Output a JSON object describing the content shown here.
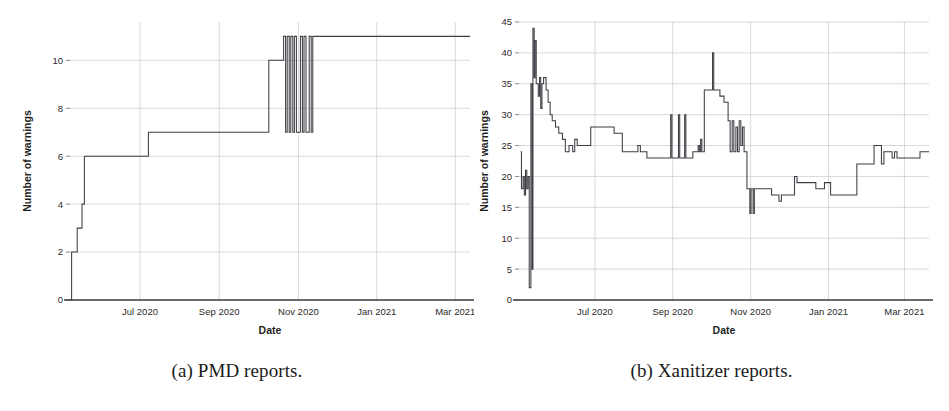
{
  "figure": {
    "subfigures": [
      {
        "key": "pmd",
        "caption": "(a) PMD reports.",
        "caption_label": "(a)",
        "caption_text": "PMD reports."
      },
      {
        "key": "xanitizer",
        "caption": "(b) Xanitizer reports.",
        "caption_label": "(b)",
        "caption_text": "Xanitizer reports."
      }
    ]
  },
  "chart_data": [
    {
      "id": "pmd",
      "type": "line",
      "title": "",
      "subtitle": "",
      "xlabel": "Date",
      "ylabel": "Number of warnings",
      "legend": [],
      "legend_position": "none",
      "grid": true,
      "grid_axes": "both",
      "step_style": "post",
      "xtick_labels": [
        "Jul 2020",
        "Sep 2020",
        "Nov 2020",
        "Jan 2021",
        "Mar 2021"
      ],
      "xtick_positions": [
        0.175,
        0.373,
        0.571,
        0.767,
        0.963
      ],
      "ytick_labels": [
        "0",
        "2",
        "4",
        "6",
        "8",
        "10"
      ],
      "ytick_values": [
        0,
        2,
        4,
        6,
        8,
        10
      ],
      "ylim": [
        0,
        11.6
      ],
      "xlim": [
        0,
        1
      ],
      "series": [
        {
          "name": "PMD warnings",
          "color": "#3d3d44",
          "points": [
            [
              0.0,
              0
            ],
            [
              0.004,
              0
            ],
            [
              0.004,
              2
            ],
            [
              0.018,
              2
            ],
            [
              0.018,
              3
            ],
            [
              0.03,
              3
            ],
            [
              0.03,
              4
            ],
            [
              0.036,
              4
            ],
            [
              0.036,
              6
            ],
            [
              0.196,
              6
            ],
            [
              0.196,
              7
            ],
            [
              0.497,
              7
            ],
            [
              0.497,
              10
            ],
            [
              0.534,
              10
            ],
            [
              0.534,
              11
            ],
            [
              0.539,
              11
            ],
            [
              0.539,
              7
            ],
            [
              0.543,
              7
            ],
            [
              0.543,
              11
            ],
            [
              0.548,
              11
            ],
            [
              0.548,
              7
            ],
            [
              0.552,
              7
            ],
            [
              0.552,
              11
            ],
            [
              0.557,
              11
            ],
            [
              0.557,
              7
            ],
            [
              0.561,
              7
            ],
            [
              0.561,
              11
            ],
            [
              0.566,
              11
            ],
            [
              0.566,
              7
            ],
            [
              0.576,
              7
            ],
            [
              0.576,
              11
            ],
            [
              0.581,
              11
            ],
            [
              0.581,
              7
            ],
            [
              0.585,
              7
            ],
            [
              0.585,
              11
            ],
            [
              0.59,
              11
            ],
            [
              0.59,
              7
            ],
            [
              0.598,
              7
            ],
            [
              0.598,
              11
            ],
            [
              0.603,
              11
            ],
            [
              0.603,
              7
            ],
            [
              0.607,
              7
            ],
            [
              0.607,
              11
            ],
            [
              1.0,
              11
            ]
          ]
        }
      ]
    },
    {
      "id": "xanitizer",
      "type": "line",
      "title": "",
      "subtitle": "",
      "xlabel": "Date",
      "ylabel": "Number of warnings",
      "legend": [],
      "legend_position": "none",
      "grid": true,
      "grid_axes": "both",
      "step_style": "post",
      "xtick_labels": [
        "Jul 2020",
        "Sep 2020",
        "Nov 2020",
        "Jan 2021",
        "Mar 2021"
      ],
      "xtick_positions": [
        0.185,
        0.375,
        0.565,
        0.755,
        0.94
      ],
      "ytick_labels": [
        "0",
        "5",
        "10",
        "15",
        "20",
        "25",
        "30",
        "35",
        "40",
        "45"
      ],
      "ytick_values": [
        0,
        5,
        10,
        15,
        20,
        25,
        30,
        35,
        40,
        45
      ],
      "ylim": [
        0,
        45
      ],
      "xlim": [
        0,
        1
      ],
      "series": [
        {
          "name": "Xanitizer warnings",
          "color": "#3d3d44",
          "points": [
            [
              0.004,
              24
            ],
            [
              0.006,
              24
            ],
            [
              0.006,
              18
            ],
            [
              0.01,
              18
            ],
            [
              0.01,
              20
            ],
            [
              0.013,
              20
            ],
            [
              0.013,
              17
            ],
            [
              0.016,
              17
            ],
            [
              0.016,
              21
            ],
            [
              0.019,
              21
            ],
            [
              0.019,
              18
            ],
            [
              0.022,
              18
            ],
            [
              0.022,
              20
            ],
            [
              0.025,
              20
            ],
            [
              0.025,
              2
            ],
            [
              0.029,
              2
            ],
            [
              0.029,
              35
            ],
            [
              0.032,
              35
            ],
            [
              0.032,
              5
            ],
            [
              0.034,
              5
            ],
            [
              0.034,
              44
            ],
            [
              0.037,
              44
            ],
            [
              0.037,
              36
            ],
            [
              0.039,
              36
            ],
            [
              0.039,
              42
            ],
            [
              0.042,
              42
            ],
            [
              0.042,
              35
            ],
            [
              0.047,
              35
            ],
            [
              0.047,
              33
            ],
            [
              0.05,
              33
            ],
            [
              0.05,
              36
            ],
            [
              0.053,
              36
            ],
            [
              0.053,
              31
            ],
            [
              0.056,
              31
            ],
            [
              0.056,
              35
            ],
            [
              0.06,
              35
            ],
            [
              0.06,
              36
            ],
            [
              0.066,
              36
            ],
            [
              0.066,
              34
            ],
            [
              0.071,
              34
            ],
            [
              0.071,
              32
            ],
            [
              0.076,
              32
            ],
            [
              0.076,
              30
            ],
            [
              0.081,
              30
            ],
            [
              0.081,
              29
            ],
            [
              0.089,
              29
            ],
            [
              0.089,
              28
            ],
            [
              0.097,
              28
            ],
            [
              0.097,
              27
            ],
            [
              0.106,
              27
            ],
            [
              0.106,
              26
            ],
            [
              0.113,
              26
            ],
            [
              0.113,
              24
            ],
            [
              0.122,
              24
            ],
            [
              0.122,
              25
            ],
            [
              0.131,
              25
            ],
            [
              0.131,
              24
            ],
            [
              0.136,
              24
            ],
            [
              0.136,
              26
            ],
            [
              0.142,
              26
            ],
            [
              0.142,
              25
            ],
            [
              0.175,
              25
            ],
            [
              0.175,
              28
            ],
            [
              0.232,
              28
            ],
            [
              0.232,
              27
            ],
            [
              0.252,
              27
            ],
            [
              0.252,
              24
            ],
            [
              0.29,
              24
            ],
            [
              0.29,
              25
            ],
            [
              0.296,
              25
            ],
            [
              0.296,
              24
            ],
            [
              0.312,
              24
            ],
            [
              0.312,
              23
            ],
            [
              0.37,
              23
            ],
            [
              0.37,
              30
            ],
            [
              0.373,
              30
            ],
            [
              0.373,
              23
            ],
            [
              0.389,
              23
            ],
            [
              0.389,
              30
            ],
            [
              0.392,
              30
            ],
            [
              0.392,
              23
            ],
            [
              0.404,
              23
            ],
            [
              0.404,
              30
            ],
            [
              0.407,
              30
            ],
            [
              0.407,
              23
            ],
            [
              0.424,
              23
            ],
            [
              0.424,
              24
            ],
            [
              0.437,
              24
            ],
            [
              0.437,
              25
            ],
            [
              0.44,
              25
            ],
            [
              0.44,
              24
            ],
            [
              0.443,
              24
            ],
            [
              0.443,
              26
            ],
            [
              0.446,
              26
            ],
            [
              0.446,
              24
            ],
            [
              0.452,
              24
            ],
            [
              0.452,
              34
            ],
            [
              0.472,
              34
            ],
            [
              0.472,
              40
            ],
            [
              0.475,
              40
            ],
            [
              0.475,
              34
            ],
            [
              0.49,
              34
            ],
            [
              0.49,
              33
            ],
            [
              0.5,
              33
            ],
            [
              0.5,
              32
            ],
            [
              0.51,
              32
            ],
            [
              0.51,
              29
            ],
            [
              0.515,
              29
            ],
            [
              0.515,
              24
            ],
            [
              0.52,
              24
            ],
            [
              0.52,
              29
            ],
            [
              0.524,
              29
            ],
            [
              0.524,
              24
            ],
            [
              0.529,
              24
            ],
            [
              0.529,
              28
            ],
            [
              0.533,
              28
            ],
            [
              0.533,
              24
            ],
            [
              0.537,
              24
            ],
            [
              0.537,
              29
            ],
            [
              0.541,
              29
            ],
            [
              0.541,
              25
            ],
            [
              0.545,
              25
            ],
            [
              0.545,
              28
            ],
            [
              0.549,
              28
            ],
            [
              0.549,
              24
            ],
            [
              0.556,
              24
            ],
            [
              0.556,
              18
            ],
            [
              0.563,
              18
            ],
            [
              0.563,
              14
            ],
            [
              0.566,
              14
            ],
            [
              0.566,
              18
            ],
            [
              0.571,
              18
            ],
            [
              0.571,
              14
            ],
            [
              0.574,
              14
            ],
            [
              0.574,
              18
            ],
            [
              0.616,
              18
            ],
            [
              0.616,
              17
            ],
            [
              0.634,
              17
            ],
            [
              0.634,
              16
            ],
            [
              0.64,
              16
            ],
            [
              0.64,
              17
            ],
            [
              0.672,
              17
            ],
            [
              0.672,
              20
            ],
            [
              0.678,
              20
            ],
            [
              0.678,
              19
            ],
            [
              0.724,
              19
            ],
            [
              0.724,
              18
            ],
            [
              0.745,
              18
            ],
            [
              0.745,
              19
            ],
            [
              0.76,
              19
            ],
            [
              0.76,
              17
            ],
            [
              0.824,
              17
            ],
            [
              0.824,
              22
            ],
            [
              0.866,
              22
            ],
            [
              0.866,
              25
            ],
            [
              0.884,
              25
            ],
            [
              0.884,
              22
            ],
            [
              0.89,
              22
            ],
            [
              0.89,
              24
            ],
            [
              0.91,
              24
            ],
            [
              0.91,
              23
            ],
            [
              0.916,
              23
            ],
            [
              0.916,
              24
            ],
            [
              0.922,
              24
            ],
            [
              0.922,
              23
            ],
            [
              0.978,
              23
            ],
            [
              0.978,
              24
            ],
            [
              1.0,
              24
            ]
          ]
        }
      ]
    }
  ]
}
